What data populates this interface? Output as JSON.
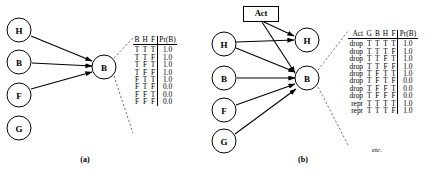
{
  "figure": {
    "panels": [
      {
        "caption": "(a)",
        "nodes": [
          {
            "id": "a-parent-h",
            "label": "H",
            "cx": 19,
            "cy": 30
          },
          {
            "id": "a-parent-b",
            "label": "B",
            "cx": 19,
            "cy": 62
          },
          {
            "id": "a-parent-f",
            "label": "F",
            "cx": 19,
            "cy": 95
          },
          {
            "id": "a-node-g",
            "label": "G",
            "cx": 19,
            "cy": 128
          },
          {
            "id": "a-child-b",
            "label": "B",
            "cx": 104,
            "cy": 67
          }
        ],
        "table": {
          "headers": [
            "B",
            "H",
            "F",
            "Pr(B)"
          ],
          "rows": [
            [
              "T",
              "T",
              "T",
              "1.0"
            ],
            [
              "T",
              "T",
              "F",
              "1.0"
            ],
            [
              "T",
              "F",
              "T",
              "1.0"
            ],
            [
              "T",
              "F",
              "F",
              "1.0"
            ],
            [
              "F",
              "T",
              "T",
              "1.0"
            ],
            [
              "F",
              "T",
              "F",
              "0.0"
            ],
            [
              "F",
              "F",
              "T",
              "0.0"
            ],
            [
              "F",
              "F",
              "F",
              "0.0"
            ]
          ]
        }
      },
      {
        "caption": "(b)",
        "action_box": {
          "label": "Act"
        },
        "nodes": [
          {
            "id": "b-parent-h",
            "label": "H",
            "cx": 224,
            "cy": 44
          },
          {
            "id": "b-parent-b",
            "label": "B",
            "cx": 224,
            "cy": 78
          },
          {
            "id": "b-parent-f",
            "label": "F",
            "cx": 224,
            "cy": 110
          },
          {
            "id": "b-parent-g",
            "label": "G",
            "cx": 224,
            "cy": 141
          },
          {
            "id": "b-child-h",
            "label": "H",
            "cx": 307,
            "cy": 40
          },
          {
            "id": "b-child-b",
            "label": "B",
            "cx": 307,
            "cy": 78
          }
        ],
        "table": {
          "headers": [
            "Act",
            "G",
            "B",
            "H",
            "F",
            "Pr(B)"
          ],
          "rows": [
            [
              "drop",
              "T",
              "T",
              "T",
              "T",
              "1.0"
            ],
            [
              "drop",
              "T",
              "T",
              "T",
              "F",
              "1.0"
            ],
            [
              "drop",
              "T",
              "T",
              "F",
              "T",
              "1.0"
            ],
            [
              "drop",
              "T",
              "T",
              "F",
              "F",
              "1.0"
            ],
            [
              "drop",
              "T",
              "F",
              "T",
              "T",
              "1.0"
            ],
            [
              "drop",
              "T",
              "F",
              "T",
              "F",
              "0.0"
            ],
            [
              "drop",
              "T",
              "F",
              "F",
              "T",
              "0.0"
            ],
            [
              "drop",
              "T",
              "F",
              "F",
              "F",
              "0.0"
            ],
            [
              "repr",
              "T",
              "T",
              "T",
              "T",
              "1.0"
            ],
            [
              "repr",
              "T",
              "T",
              "T",
              "F",
              "1.0"
            ]
          ],
          "continuation": "etc."
        }
      }
    ]
  },
  "colors": {
    "stroke": "#000000",
    "background": "#ffffff"
  }
}
